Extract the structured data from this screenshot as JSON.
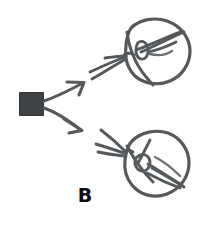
{
  "figure": {
    "panel_label": "B",
    "background_color": "#ffffff",
    "stroke_color": "#55595b",
    "stroke_color_light": "#6b6f71",
    "source_color": "#404346",
    "label_color": "#0d0d0d",
    "width": 213,
    "height": 229
  },
  "diagram": {
    "type": "hand-drawn-schematic",
    "source": {
      "name": "emitter-square",
      "shape": "filled-square",
      "x": 19,
      "y": 92,
      "width": 25,
      "height": 24,
      "color": "#404346"
    },
    "arrows": [
      {
        "name": "arrow-upper",
        "from_x": 44,
        "from_y": 100,
        "to_x": 84,
        "to_y": 83,
        "direction": "upper-right"
      },
      {
        "name": "arrow-lower",
        "from_x": 44,
        "from_y": 108,
        "to_x": 82,
        "to_y": 130,
        "direction": "lower-right"
      }
    ],
    "targets": [
      {
        "name": "target-circle-top",
        "cx": 157,
        "cy": 52,
        "r": 34,
        "rays": 4,
        "has_inner_marking": true
      },
      {
        "name": "target-circle-bottom",
        "cx": 155,
        "cy": 165,
        "r": 33,
        "rays": 4,
        "has_inner_marking": true
      }
    ]
  }
}
